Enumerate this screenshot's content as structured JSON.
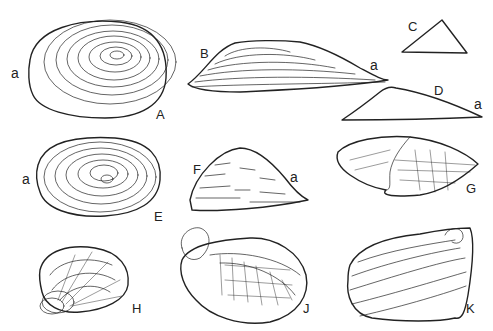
{
  "figure": {
    "panels": [
      {
        "id": "A",
        "label": "A",
        "sub_label": "a",
        "shape": "oval shell, concentric growth lines"
      },
      {
        "id": "B",
        "label": "B",
        "sub_label": "a",
        "shape": "elongated shell, concentric growth lines"
      },
      {
        "id": "C",
        "label": "C",
        "shape": "triangular outline"
      },
      {
        "id": "D",
        "label": "D",
        "sub_label": "a",
        "shape": "elongated outline"
      },
      {
        "id": "E",
        "label": "E",
        "sub_label": "a",
        "shape": "oval shell, concentric growth lines"
      },
      {
        "id": "F",
        "label": "F",
        "sub_label": "a",
        "shape": "triangular shell, growth lines"
      },
      {
        "id": "G",
        "label": "G",
        "shape": "opened elongate bivalve"
      },
      {
        "id": "H",
        "label": "H",
        "shape": "shell with radial and concentric lines"
      },
      {
        "id": "J",
        "label": "J",
        "shape": "opened bivalve with interior"
      },
      {
        "id": "K",
        "label": "K",
        "shape": "shell with coiled umbo"
      }
    ]
  }
}
